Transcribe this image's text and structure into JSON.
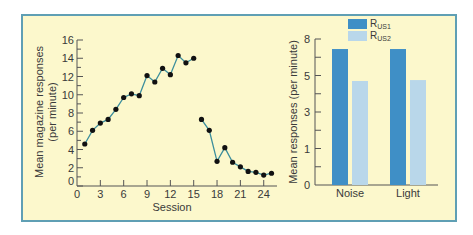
{
  "chart_data": [
    {
      "type": "line",
      "title": "",
      "xlabel": "Session",
      "ylabel": "Mean magazine responses (per minute)",
      "ylabel_lines": [
        "Mean magazine responses",
        "(per minute)"
      ],
      "xlim": [
        0,
        26
      ],
      "ylim": [
        0,
        16
      ],
      "xticks": [
        0,
        3,
        6,
        9,
        12,
        15,
        18,
        21,
        24
      ],
      "yticks": [
        0,
        2,
        4,
        6,
        8,
        10,
        12,
        14,
        16
      ],
      "y_minor_step": 1,
      "grid": false,
      "series": [
        {
          "name": "Acquisition",
          "x": [
            1,
            2,
            3,
            4,
            5,
            6,
            7,
            8,
            9,
            10,
            11,
            12,
            13,
            14,
            15
          ],
          "values": [
            4.6,
            6.1,
            6.9,
            7.3,
            8.4,
            9.7,
            10.1,
            9.9,
            12.1,
            11.4,
            12.9,
            12.2,
            14.3,
            13.5,
            14.0
          ]
        },
        {
          "name": "Extinction",
          "x": [
            16,
            17,
            18,
            19,
            20,
            21,
            22,
            23,
            24,
            25
          ],
          "values": [
            7.3,
            6.1,
            2.7,
            4.2,
            2.6,
            2.1,
            1.6,
            1.5,
            1.2,
            1.4
          ]
        }
      ],
      "line_color": "#3b8e9c",
      "marker_color": "#111111"
    },
    {
      "type": "bar",
      "title": "",
      "xlabel": "",
      "ylabel": "Mean responses (per minute)",
      "categories": [
        "Noise",
        "Light"
      ],
      "ytick_labels": [
        "0",
        "1",
        "3",
        "5",
        "8"
      ],
      "ytick_positions": [
        0,
        2,
        4,
        6,
        8
      ],
      "ylim": [
        0,
        8
      ],
      "y_minor_step": 1,
      "legend_position": "top",
      "series": [
        {
          "name": "R_US1",
          "label_main": "R",
          "label_sub": "US1",
          "color": "#3f8fc6",
          "values": [
            7.45,
            7.45
          ]
        },
        {
          "name": "R_US2",
          "label_main": "R",
          "label_sub": "US2",
          "color": "#b9d7ea",
          "values": [
            5.7,
            5.75
          ]
        }
      ]
    }
  ],
  "colors": {
    "background": "#fcf8cc",
    "border": "#5f9fb4",
    "axis": "#555555",
    "text": "#3a3a3a"
  }
}
